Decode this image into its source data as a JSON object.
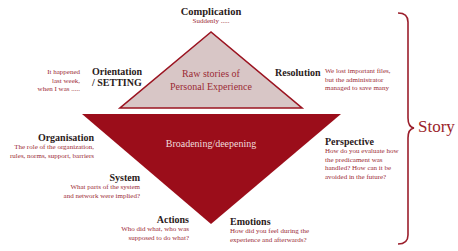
{
  "colors": {
    "upper_triangle_fill": "#d8c6c6",
    "upper_triangle_stroke": "#9b1421",
    "lower_triangle_fill": "#9b0d1a",
    "accent_text": "#9b2a35",
    "heading_text": "#2a2020",
    "bracket": "#9b1f2c"
  },
  "upper_triangle": {
    "line1": "Raw stories of",
    "line2": "Personal Experience"
  },
  "lower_triangle": {
    "label": "Broadening/deepening"
  },
  "complication": {
    "title": "Complication",
    "text": "Suddenly ....."
  },
  "orientation": {
    "title_line1": "Orientation",
    "title_line2": "/ SETTING",
    "text_line1": "It happened",
    "text_line2": "last week,",
    "text_line3": "when I was ....."
  },
  "resolution": {
    "title": "Resolution",
    "text_line1": "We lost important files,",
    "text_line2": "but the administrator",
    "text_line3": "managed to save many"
  },
  "organisation": {
    "title": "Organisation",
    "text_line1": "The role of the organization,",
    "text_line2": "rules, norms, support, barriers"
  },
  "system": {
    "title": "System",
    "text_line1": "What parts of the system",
    "text_line2": "and  network were implied?"
  },
  "actions": {
    "title": "Actions",
    "text_line1": "Who did what, who was",
    "text_line2": "supposed to do what?"
  },
  "emotions": {
    "title": "Emotions",
    "text_line1": "How did you feel during the",
    "text_line2": "experience and afterwards?"
  },
  "perspective": {
    "title": "Perspective",
    "text_line1": "How do you evaluate how",
    "text_line2": "the predicament was",
    "text_line3": "handled? How can it be",
    "text_line4": "avoided in the future?"
  },
  "bracket": {
    "label": "Story"
  }
}
